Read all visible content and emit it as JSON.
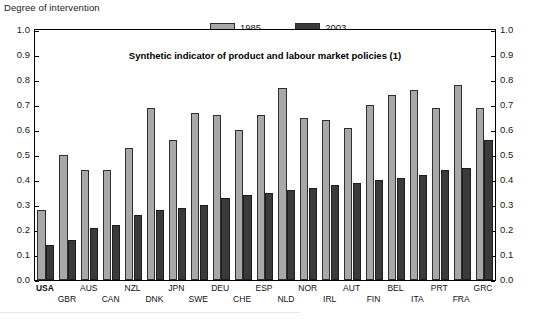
{
  "axis_caption": "Degree of intervention",
  "legend": {
    "position": "top-center",
    "entries": [
      {
        "label": "1985",
        "color": "#a8a8a8",
        "name": "legend-1985"
      },
      {
        "label": "2003",
        "color": "#3a3a3a",
        "name": "legend-2003"
      }
    ]
  },
  "chart_data": {
    "type": "bar",
    "title": "Synthetic indicator of product and labour market policies (1)",
    "xlabel": "",
    "ylabel": "Degree of intervention",
    "ylim": [
      0.0,
      1.0
    ],
    "ytick_labels": [
      "0.0",
      "0.1",
      "0.2",
      "0.3",
      "0.4",
      "0.5",
      "0.6",
      "0.7",
      "0.8",
      "0.9",
      "1.0"
    ],
    "ytick_values": [
      0.0,
      0.1,
      0.2,
      0.3,
      0.4,
      0.5,
      0.6,
      0.7,
      0.8,
      0.9,
      1.0
    ],
    "grid": false,
    "dual_y_axis": true,
    "legend_position": "top-center",
    "categories": [
      "USA",
      "GBR",
      "AUS",
      "CAN",
      "NZL",
      "DNK",
      "JPN",
      "SWE",
      "DEU",
      "CHE",
      "ESP",
      "NLD",
      "NOR",
      "IRL",
      "AUT",
      "FIN",
      "BEL",
      "ITA",
      "PRT",
      "FRA",
      "GRC"
    ],
    "series": [
      {
        "name": "1985",
        "color": "#a8a8a8",
        "values": [
          0.28,
          0.5,
          0.44,
          0.44,
          0.53,
          0.69,
          0.56,
          0.67,
          0.66,
          0.6,
          0.66,
          0.77,
          0.65,
          0.64,
          0.61,
          0.7,
          0.74,
          0.76,
          0.69,
          0.78,
          0.69
        ]
      },
      {
        "name": "2003",
        "color": "#3a3a3a",
        "values": [
          0.14,
          0.16,
          0.21,
          0.22,
          0.26,
          0.28,
          0.29,
          0.3,
          0.33,
          0.34,
          0.35,
          0.36,
          0.37,
          0.38,
          0.39,
          0.4,
          0.41,
          0.42,
          0.44,
          0.45,
          0.56
        ]
      }
    ]
  }
}
